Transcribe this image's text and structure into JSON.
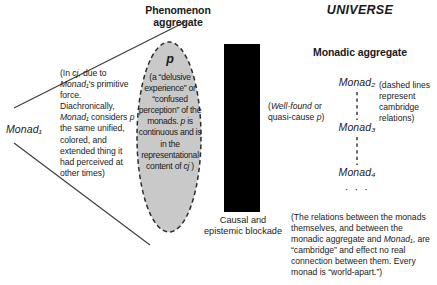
{
  "figure": {
    "phenomenon_heading_line1": "Phenomenon",
    "phenomenon_heading_line2": "aggregate",
    "universe_heading": "UNIVERSE",
    "monadic_heading": "Monadic aggregate",
    "left_note": "(In cj, due to Monad₁'s primitive force. Diachronically, Monad₁ considers p the same unified, colored, and extended thing it had perceived at other times)",
    "monad1_label": "Monad₁",
    "p_symbol": "p",
    "ellipse_body": "(a “delusive experience” or “confused perception” of the monads. p is continuous and is in the representational content of cj )",
    "blockade_caption": "Causal and epistemic blockade",
    "quasicause_note": "(Well-found or quasi-cause p)",
    "monad2": "Monad₂",
    "monad3": "Monad₃",
    "monad4": "Monad₄",
    "monad_dots": "· · ·",
    "dashed_note": "(dashed lines represent cambridge relations)",
    "relations_note": "(The relations between the monads themselves, and between the monadic aggregate and Monad₁, are “cambridge” and effect no real connection between them. Every monad is “world-apart.”)",
    "colors": {
      "ellipse_fill": "#c9c9c9",
      "ellipse_stroke": "#2b2b2b",
      "blockade_fill": "#000000",
      "line_stroke": "#3a3a3a",
      "text": "#1a1a1a",
      "background": "#ffffff"
    }
  }
}
